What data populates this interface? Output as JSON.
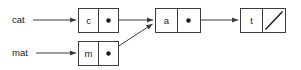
{
  "diagram": {
    "colors": {
      "background": "#ffffff",
      "box_stroke": "#3c3c3c",
      "line": "#3c3c3c",
      "text": "#1a1a1a",
      "dot": "#1a1a1a"
    },
    "variables": [
      {
        "id": "var-cat",
        "label": "cat",
        "x": 12,
        "y": 20
      },
      {
        "id": "var-mat",
        "label": "mat",
        "x": 12,
        "y": 53
      }
    ],
    "nodes": [
      {
        "id": "node-c",
        "char": "c",
        "x": 78,
        "y": 8,
        "width": 40,
        "height": 24,
        "divider_x": 98,
        "dot": {
          "x": 108,
          "y": 20,
          "r": 2.2
        },
        "pointer": "next"
      },
      {
        "id": "node-a",
        "char": "a",
        "x": 155,
        "y": 8,
        "width": 45,
        "height": 24,
        "divider_x": 177,
        "dot": {
          "x": 188,
          "y": 20,
          "r": 2.2
        },
        "pointer": "next"
      },
      {
        "id": "node-t",
        "char": "t",
        "x": 240,
        "y": 8,
        "width": 45,
        "height": 24,
        "divider_x": 262,
        "dot": null,
        "pointer": "null"
      },
      {
        "id": "node-m",
        "char": "m",
        "x": 78,
        "y": 41,
        "width": 40,
        "height": 24,
        "divider_x": 98,
        "dot": {
          "x": 108,
          "y": 53,
          "r": 2.2
        },
        "pointer": "next"
      }
    ],
    "edges": [
      {
        "id": "edge-cat-to-c",
        "from": "var-cat",
        "to": "node-c",
        "x1": 33,
        "y1": 20,
        "x2": 78,
        "y2": 20,
        "kind": "straight"
      },
      {
        "id": "edge-mat-to-m",
        "from": "var-mat",
        "to": "node-m",
        "x1": 36,
        "y1": 53,
        "x2": 78,
        "y2": 53,
        "kind": "straight"
      },
      {
        "id": "edge-c-to-a",
        "from": "node-c",
        "to": "node-a",
        "x1": 108,
        "y1": 20,
        "x2": 155,
        "y2": 20,
        "kind": "straight"
      },
      {
        "id": "edge-a-to-t",
        "from": "node-a",
        "to": "node-t",
        "x1": 188,
        "y1": 20,
        "x2": 240,
        "y2": 20,
        "kind": "straight"
      },
      {
        "id": "edge-m-to-a",
        "from": "node-m",
        "to": "node-a",
        "x1": 108,
        "y1": 53,
        "x2": 154,
        "y2": 23,
        "kind": "diagonal"
      }
    ],
    "null_pointer": {
      "id": "null-slash-t",
      "node": "node-t",
      "x1": 265,
      "y1": 29,
      "x2": 282,
      "y2": 11
    }
  }
}
